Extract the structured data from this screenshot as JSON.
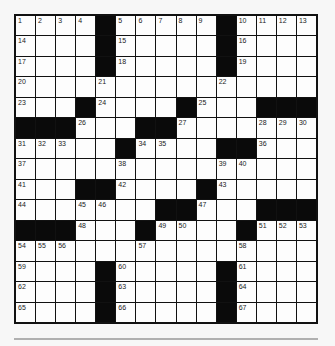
{
  "puzzle": {
    "rows": 15,
    "cols": 15,
    "layout": [
      "....#.....#....",
      "....#.....#....",
      "....#.....#....",
      "...............",
      "...#....#...###",
      "###...##.......",
      ".....#....##...",
      "...............",
      "...##....#.....",
      ".......##...###",
      "###...#....#...",
      "...............",
      "....#.....#....",
      "....#.....#....",
      "....#.....#...."
    ],
    "numbers": {
      "0,0": "1",
      "0,1": "2",
      "0,2": "3",
      "0,3": "4",
      "0,5": "5",
      "0,6": "6",
      "0,7": "7",
      "0,8": "8",
      "0,9": "9",
      "0,11": "10",
      "0,12": "11",
      "0,13": "12",
      "0,14": "13",
      "1,0": "14",
      "1,5": "15",
      "1,11": "16",
      "2,0": "17",
      "2,5": "18",
      "2,11": "19",
      "3,0": "20",
      "3,4": "21",
      "3,10": "22",
      "4,0": "23",
      "4,4": "24",
      "4,9": "25",
      "5,3": "26",
      "5,8": "27",
      "5,12": "28",
      "5,13": "29",
      "5,14": "30",
      "6,0": "31",
      "6,1": "32",
      "6,2": "33",
      "6,6": "34",
      "6,7": "35",
      "6,12": "36",
      "7,0": "37",
      "7,5": "38",
      "7,10": "39",
      "7,11": "40",
      "8,0": "41",
      "8,5": "42",
      "8,10": "43",
      "9,0": "44",
      "9,3": "45",
      "9,4": "46",
      "9,9": "47",
      "10,3": "48",
      "10,7": "49",
      "10,8": "50",
      "10,12": "51",
      "10,13": "52",
      "10,14": "53",
      "11,0": "54",
      "11,1": "55",
      "11,2": "56",
      "11,6": "57",
      "11,11": "58",
      "12,0": "59",
      "12,5": "60",
      "12,11": "61",
      "13,0": "62",
      "13,5": "63",
      "13,11": "64",
      "14,0": "65",
      "14,5": "66",
      "14,11": "67"
    }
  }
}
